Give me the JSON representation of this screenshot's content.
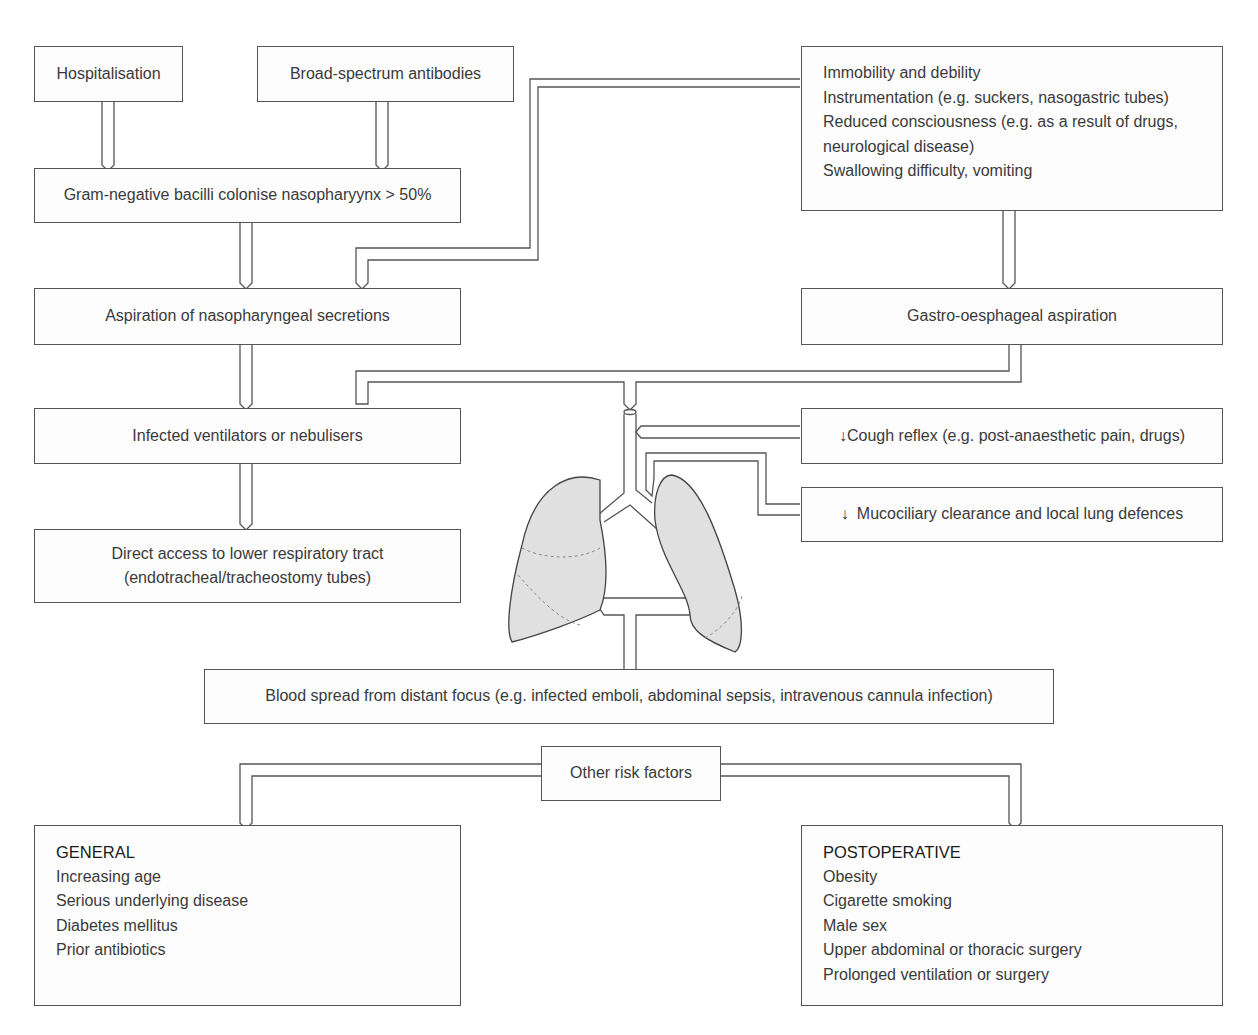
{
  "diagram": {
    "top_left": {
      "hospitalisation": "Hospitalisation",
      "antibodies": "Broad-spectrum antibodies",
      "colonise": "Gram-negative bacilli colonise nasopharyynx > 50%",
      "aspiration": "Aspiration of nasopharyngeal secretions",
      "ventilators": "Infected ventilators or nebulisers",
      "direct_access": [
        "Direct access to lower respiratory tract",
        "(endotracheal/tracheostomy tubes)"
      ]
    },
    "top_right": {
      "factors": [
        "Immobility and debility",
        "Instrumentation (e.g. suckers, nasogastric tubes)",
        "Reduced consciousness (e.g. as a result of drugs,",
        "neurological disease)",
        "Swallowing difficulty, vomiting"
      ],
      "gastro": "Gastro-oesphageal aspiration",
      "cough": "Cough reflex (e.g. post-anaesthetic pain, drugs)",
      "mucociliary": "Mucociliary clearance and local lung defences",
      "decrease_symbol": "↓"
    },
    "blood_spread": "Blood spread from distant focus (e.g. infected emboli, abdominal sepsis, intravenous cannula infection)",
    "other_risk": "Other risk factors",
    "general": {
      "title": "GENERAL",
      "items": [
        "Increasing age",
        "Serious underlying disease",
        "Diabetes mellitus",
        "Prior antibiotics"
      ]
    },
    "postoperative": {
      "title": "POSTOPERATIVE",
      "items": [
        "Obesity",
        "Cigarette smoking",
        "Male sex",
        "Upper abdominal or thoracic surgery",
        "Prolonged ventilation or surgery"
      ]
    },
    "colors": {
      "line": "#555555",
      "lung_fill": "#e0e0e0",
      "text": "#3a3a3a"
    }
  }
}
